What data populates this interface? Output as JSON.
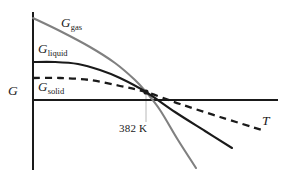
{
  "figure": {
    "background_color": "#ffffff",
    "axis_color": "#1a1a1a",
    "text_color": "#1a1a1a"
  },
  "axes": {
    "y_label": "G",
    "x_label": "T"
  },
  "curves": {
    "gas": {
      "label_var": "G",
      "label_sub": "gas",
      "color": "#808080",
      "style": "solid"
    },
    "liquid": {
      "label_var": "G",
      "label_sub": "liquid",
      "color": "#1a1a1a",
      "style": "solid"
    },
    "solid": {
      "label_var": "G",
      "label_sub": "solid",
      "color": "#1a1a1a",
      "style": "dashed"
    }
  },
  "annotations": {
    "transition_temperature": "382 K"
  },
  "chart_data": {
    "type": "line",
    "title": "",
    "xlabel": "T",
    "ylabel": "G",
    "grid": false,
    "legend": "inline-curve-labels",
    "xlim": [
      33,
      278
    ],
    "ylim": [
      170,
      12
    ],
    "annotations": [
      {
        "text": "382 K",
        "x": 146,
        "y": 128,
        "note": "transition temperature at curve crossing"
      }
    ],
    "crossing_point": {
      "x": 146,
      "y": 92
    },
    "series": [
      {
        "name": "G_gas",
        "color": "#808080",
        "style": "solid",
        "points": [
          [
            33,
            18
          ],
          [
            60,
            31
          ],
          [
            90,
            47
          ],
          [
            115,
            63
          ],
          [
            135,
            80
          ],
          [
            146,
            92
          ],
          [
            160,
            110
          ],
          [
            178,
            140
          ],
          [
            196,
            168
          ]
        ]
      },
      {
        "name": "G_liquid",
        "color": "#1a1a1a",
        "style": "solid",
        "points": [
          [
            33,
            62
          ],
          [
            55,
            62
          ],
          [
            78,
            64
          ],
          [
            100,
            70
          ],
          [
            120,
            78
          ],
          [
            146,
            92
          ],
          [
            175,
            112
          ],
          [
            205,
            131
          ],
          [
            232,
            148
          ]
        ]
      },
      {
        "name": "G_solid",
        "color": "#1a1a1a",
        "style": "dashed",
        "points": [
          [
            33,
            78
          ],
          [
            60,
            78
          ],
          [
            90,
            80
          ],
          [
            120,
            86
          ],
          [
            146,
            92
          ],
          [
            180,
            104
          ],
          [
            220,
            117
          ],
          [
            262,
            130
          ]
        ]
      }
    ]
  }
}
